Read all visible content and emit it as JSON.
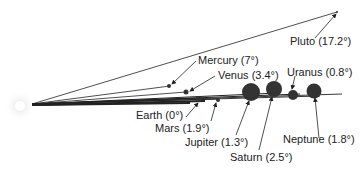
{
  "diagram": {
    "colors": {
      "line": "#222222",
      "planet": "#333333",
      "sun_glow": "#e8e8e8",
      "text": "#222222"
    },
    "planets": [
      {
        "name": "Mercury",
        "inclination": "7°",
        "label": "Mercury (7°)"
      },
      {
        "name": "Venus",
        "inclination": "3.4°",
        "label": "Venus (3.4°)"
      },
      {
        "name": "Earth",
        "inclination": "0°",
        "label": "Earth (0°)"
      },
      {
        "name": "Mars",
        "inclination": "1.9°",
        "label": "Mars (1.9°)"
      },
      {
        "name": "Jupiter",
        "inclination": "1.3°",
        "label": "Jupiter (1.3°)"
      },
      {
        "name": "Saturn",
        "inclination": "2.5°",
        "label": "Saturn (2.5°)"
      },
      {
        "name": "Uranus",
        "inclination": "0.8°",
        "label": "Uranus (0.8°)"
      },
      {
        "name": "Neptune",
        "inclination": "1.8°",
        "label": "Neptune (1.8°)"
      },
      {
        "name": "Pluto",
        "inclination": "17.2°",
        "label": "Pluto (17.2°)"
      }
    ]
  }
}
